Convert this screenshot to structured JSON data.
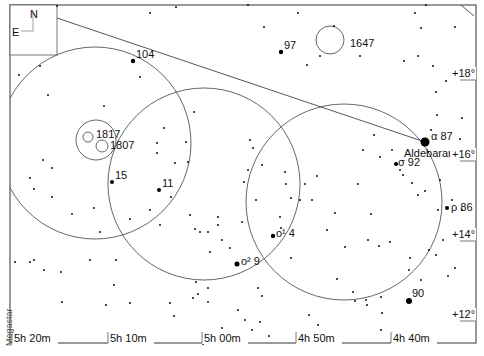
{
  "chart_data": {
    "type": "star-chart",
    "title": "",
    "credit": "Megastar",
    "compass": {
      "north": "N",
      "east": "E"
    },
    "ra_labels": [
      {
        "label": "5h 20m",
        "x": 14
      },
      {
        "label": "5h 10m",
        "x": 110
      },
      {
        "label": "5h 00m",
        "x": 204
      },
      {
        "label": "4h 50m",
        "x": 298
      },
      {
        "label": "4h 40m",
        "x": 393
      }
    ],
    "dec_labels": [
      {
        "label": "+18°",
        "y": 77
      },
      {
        "label": "+16°",
        "y": 158
      },
      {
        "label": "+14°",
        "y": 238
      },
      {
        "label": "+12°",
        "y": 318
      }
    ],
    "named_objects": [
      {
        "label": "104",
        "x": 133,
        "y": 61,
        "size": 2.2
      },
      {
        "label": "97",
        "x": 281,
        "y": 52,
        "size": 2.2
      },
      {
        "label": "1647",
        "x": 350,
        "y": 43,
        "type": "cluster"
      },
      {
        "label": "1817",
        "x": 96,
        "y": 137,
        "type": "cluster"
      },
      {
        "label": "1807",
        "x": 110,
        "y": 146,
        "type": "cluster"
      },
      {
        "label": "15",
        "x": 112,
        "y": 182,
        "size": 2
      },
      {
        "label": "11",
        "x": 159,
        "y": 190,
        "size": 2
      },
      {
        "label": "α 87",
        "x": 425,
        "y": 142,
        "size": 4.5
      },
      {
        "label": "Aldebaran",
        "x": 410,
        "y": 157
      },
      {
        "label": "σ 92",
        "x": 396,
        "y": 164,
        "size": 2
      },
      {
        "label": "ρ 86",
        "x": 447,
        "y": 208,
        "size": 2
      },
      {
        "label": "o¹ 4",
        "x": 273,
        "y": 236,
        "size": 2.2
      },
      {
        "label": "o² 9",
        "x": 237,
        "y": 264,
        "size": 2.5
      },
      {
        "label": "90",
        "x": 409,
        "y": 301,
        "size": 3
      }
    ],
    "field_circles": [
      {
        "cx": 95,
        "cy": 143,
        "r": 96
      },
      {
        "cx": 204,
        "cy": 184,
        "r": 96
      },
      {
        "cx": 344,
        "cy": 202,
        "r": 98
      }
    ],
    "cluster_circles": [
      {
        "cx": 96,
        "cy": 140,
        "r": 20
      },
      {
        "cx": 88,
        "cy": 137,
        "r": 5
      },
      {
        "cx": 102,
        "cy": 146,
        "r": 6
      },
      {
        "cx": 330,
        "cy": 40,
        "r": 14
      }
    ],
    "guide_line": {
      "x1": 57,
      "y1": 18,
      "x2": 425,
      "y2": 142
    }
  }
}
